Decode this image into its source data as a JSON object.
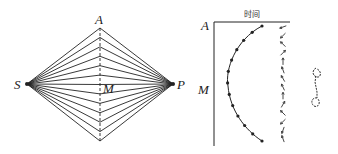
{
  "left_diagram": {
    "labels": {
      "top": "A",
      "left": "S",
      "right": "P",
      "middle": "M"
    },
    "vertical_points": 13
  },
  "right_diagram": {
    "axis_title": "时间",
    "labels": {
      "top": "A",
      "middle": "M"
    },
    "curve_points": 13,
    "arrow_count": 14
  },
  "colors": {
    "ink": "#222222",
    "background": "#ffffff"
  }
}
